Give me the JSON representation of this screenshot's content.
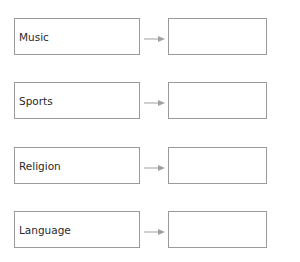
{
  "diagram": {
    "rows": [
      {
        "label": "Music",
        "target": ""
      },
      {
        "label": "Sports",
        "target": ""
      },
      {
        "label": "Religion",
        "target": ""
      },
      {
        "label": "Language",
        "target": ""
      }
    ],
    "colors": {
      "border": "#9a9a9a",
      "arrow": "#a0a0a0",
      "text": "#2a2a2a"
    }
  }
}
